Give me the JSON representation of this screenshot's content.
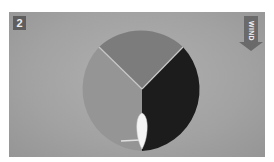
{
  "diagram": {
    "step_number": "2",
    "wind_label": "WIND",
    "wind_direction": "down",
    "sectors": [
      {
        "name": "upwind-sector",
        "color": "#7c7c7c"
      },
      {
        "name": "port-sector",
        "color": "#959595"
      },
      {
        "name": "starboard-sector",
        "color": "#1c1c1c"
      }
    ],
    "separator_color": "#c8c8c8",
    "boat_color": "#f4f4f4",
    "panel_color": "#a6a6a6"
  }
}
